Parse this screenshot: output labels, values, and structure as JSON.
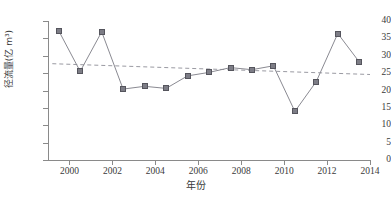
{
  "chart_data": {
    "type": "line",
    "title": "",
    "xlabel": "年份",
    "ylabel": "径流量(亿 m³)",
    "xlim": [
      1999,
      2014
    ],
    "ylim": [
      0,
      40
    ],
    "xticks": [
      "2000",
      "2002",
      "2004",
      "2006",
      "2008",
      "2010",
      "2012",
      "2014"
    ],
    "xtick_values": [
      2000,
      2002,
      2004,
      2006,
      2008,
      2010,
      2012,
      2014
    ],
    "yticks": [
      "0",
      "5",
      "10",
      "15",
      "20",
      "25",
      "30",
      "35",
      "40"
    ],
    "ytick_values": [
      0,
      5,
      10,
      15,
      20,
      25,
      30,
      35,
      40
    ],
    "grid": false,
    "legend": "none",
    "x": [
      1999.5,
      2000.5,
      2001.5,
      2002.5,
      2003.5,
      2004.5,
      2005.5,
      2006.5,
      2007.5,
      2008.5,
      2009.5,
      2010.5,
      2011.5,
      2012.5,
      2013.5
    ],
    "categories": [
      "1999",
      "2000",
      "2001",
      "2002",
      "2003",
      "2004",
      "2005",
      "2006",
      "2007",
      "2008",
      "2009",
      "2010",
      "2011",
      "2012",
      "2013"
    ],
    "series": [
      {
        "name": "径流量",
        "marker": "square",
        "color": "#7d7d86",
        "line_color": "#8a8a92",
        "values": [
          37.2,
          25.5,
          36.9,
          20.4,
          21.2,
          20.6,
          24.2,
          25.2,
          26.6,
          26.0,
          27.1,
          14.0,
          22.6,
          36.4,
          28.2
        ]
      }
    ],
    "trendline": {
      "name": "线性趋势线",
      "style": "dashed",
      "color": "#9a9aa2",
      "x_start": 1999.2,
      "y_start": 27.7,
      "x_end": 2014.0,
      "y_end": 24.6
    }
  }
}
